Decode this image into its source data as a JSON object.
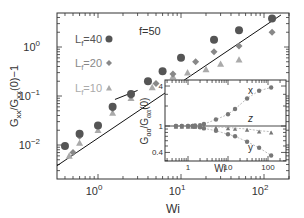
{
  "chart_data": [
    {
      "type": "scatter",
      "title": "",
      "annotation": "f=50",
      "xlabel": "Wi",
      "ylabel": "G_xx/G_xx(0)−1",
      "xscale": "log",
      "yscale": "log",
      "xlim": [
        0.3,
        180
      ],
      "ylim": [
        0.0035,
        4.5
      ],
      "xticks": [
        "10^0",
        "10^1",
        "10^2"
      ],
      "yticks": [
        "10^-2",
        "10^-1",
        "10^0"
      ],
      "legend_position": "upper left",
      "series": [
        {
          "name": "L_f=40",
          "marker": "circle",
          "color": "#555555",
          "x": [
            0.4,
            0.6,
            1.0,
            1.5,
            2.5,
            4.0,
            6.0,
            10,
            25,
            50,
            125
          ],
          "y": [
            0.0095,
            0.017,
            0.025,
            0.06,
            0.11,
            0.2,
            0.32,
            0.6,
            1.4,
            2.2,
            3.8
          ]
        },
        {
          "name": "L_f=20",
          "marker": "diamond",
          "color": "#888888",
          "x": [
            0.5,
            0.6,
            1.0,
            1.5,
            2.5,
            5,
            8,
            15,
            25,
            50,
            125
          ],
          "y": [
            0.007,
            0.015,
            0.025,
            0.055,
            0.1,
            0.18,
            0.28,
            0.5,
            0.8,
            1.05,
            2.0
          ]
        },
        {
          "name": "L_f=10",
          "marker": "triangle",
          "color": "#aaaaaa",
          "x": [
            0.45,
            0.6,
            1.0,
            1.5,
            2.5,
            4.5,
            8,
            12,
            20,
            30,
            50
          ],
          "y": [
            0.006,
            0.011,
            0.02,
            0.045,
            0.09,
            0.15,
            0.25,
            0.3,
            0.35,
            0.45,
            0.55
          ]
        }
      ],
      "lines": [
        {
          "name": "power-law fit",
          "x": [
            0.3,
            160
          ],
          "y": [
            0.0035,
            4.5
          ]
        },
        {
          "name": "short segment",
          "x": [
            1.6,
            3.0
          ],
          "y": [
            0.085,
            0.13
          ]
        }
      ]
    },
    {
      "type": "scatter",
      "title": "inset",
      "xlabel": "Wi",
      "ylabel": "G_αα/G_αα(0)",
      "xscale": "log",
      "yscale": "log",
      "xlim": [
        0.5,
        150
      ],
      "ylim": [
        0.3,
        5
      ],
      "xticks": [
        "1",
        "10",
        "100"
      ],
      "yticks": [
        "0.4",
        "1",
        "4"
      ],
      "series": [
        {
          "name": "x",
          "x": [
            0.5,
            0.7,
            1.0,
            1.3,
            1.5,
            2,
            2.5,
            5,
            10,
            15,
            30,
            60,
            120
          ],
          "y": [
            1.0,
            1.0,
            1.0,
            1.0,
            1.02,
            1.03,
            1.07,
            1.25,
            1.5,
            1.8,
            2.6,
            3.4,
            3.8
          ]
        },
        {
          "name": "z",
          "x": [
            0.5,
            0.7,
            1.0,
            1.3,
            1.5,
            2,
            2.5,
            5,
            10,
            15,
            30,
            60,
            120
          ],
          "y": [
            1.0,
            1.0,
            1.0,
            1.0,
            1.0,
            1.0,
            0.98,
            0.97,
            0.95,
            0.93,
            0.9,
            0.85,
            0.82
          ]
        },
        {
          "name": "y",
          "x": [
            0.5,
            0.7,
            1.0,
            1.3,
            1.5,
            2,
            2.5,
            5,
            10,
            15,
            30,
            60,
            120
          ],
          "y": [
            1.0,
            1.0,
            1.0,
            1.0,
            0.98,
            0.96,
            0.92,
            0.85,
            0.75,
            0.7,
            0.58,
            0.47,
            0.36
          ]
        }
      ],
      "lines": [
        {
          "name": "unity",
          "y": 1
        }
      ]
    }
  ],
  "labels": {
    "annotation": "f=50",
    "xlabel": "Wi",
    "ylabel": "G",
    "legend": [
      "L",
      "L",
      "L"
    ],
    "legend_vals": [
      "=40",
      "=20",
      "=10"
    ],
    "inset_x_series": "x",
    "inset_z_series": "z",
    "inset_y_series": "y",
    "inset_xlabel": "Wi"
  }
}
